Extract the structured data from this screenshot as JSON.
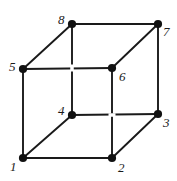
{
  "figure": {
    "kind": "cube-vertex-diagram",
    "width": 177,
    "height": 181,
    "background_color": "#ffffff",
    "edge_color": "#1a1a1a",
    "vertex_color": "#111111",
    "label_color": "#1a1a1a",
    "edge_width": 1.9,
    "hidden_edge_style": "interrupted-at-crossing",
    "vertex_radius": 4.1
  },
  "vertices": [
    {
      "id": "v1",
      "label": "1",
      "x": 23,
      "y": 158,
      "label_x": 10,
      "label_y": 160,
      "hidden": false
    },
    {
      "id": "v2",
      "label": "2",
      "x": 112,
      "y": 158,
      "label_x": 118,
      "label_y": 161,
      "hidden": false
    },
    {
      "id": "v3",
      "label": "3",
      "x": 158,
      "y": 114,
      "label_x": 163,
      "label_y": 116,
      "hidden": false
    },
    {
      "id": "v4",
      "label": "4",
      "x": 72,
      "y": 115,
      "label_x": 58,
      "label_y": 104,
      "hidden": true
    },
    {
      "id": "v5",
      "label": "5",
      "x": 23,
      "y": 69,
      "label_x": 9,
      "label_y": 60,
      "hidden": false
    },
    {
      "id": "v6",
      "label": "6",
      "x": 112,
      "y": 68,
      "label_x": 119,
      "label_y": 70,
      "hidden": false
    },
    {
      "id": "v7",
      "label": "7",
      "x": 158,
      "y": 24,
      "label_x": 163,
      "label_y": 25,
      "hidden": false
    },
    {
      "id": "v8",
      "label": "8",
      "x": 72,
      "y": 24,
      "label_x": 58,
      "label_y": 13,
      "hidden": false
    }
  ],
  "edges": [
    {
      "id": "e-1-2",
      "from": "v1",
      "to": "v2",
      "face": "front",
      "hidden": false
    },
    {
      "id": "e-2-6",
      "from": "v2",
      "to": "v6",
      "face": "front",
      "hidden": false
    },
    {
      "id": "e-6-5",
      "from": "v6",
      "to": "v5",
      "face": "front",
      "hidden": false
    },
    {
      "id": "e-5-1",
      "from": "v5",
      "to": "v1",
      "face": "front",
      "hidden": false
    },
    {
      "id": "e-4-3",
      "from": "v4",
      "to": "v3",
      "face": "back",
      "hidden": true
    },
    {
      "id": "e-3-7",
      "from": "v3",
      "to": "v7",
      "face": "back",
      "hidden": false
    },
    {
      "id": "e-7-8",
      "from": "v7",
      "to": "v8",
      "face": "back",
      "hidden": false
    },
    {
      "id": "e-8-4",
      "from": "v8",
      "to": "v4",
      "face": "back",
      "hidden": true
    },
    {
      "id": "e-1-4",
      "from": "v1",
      "to": "v4",
      "face": "connect",
      "hidden": false
    },
    {
      "id": "e-2-3",
      "from": "v2",
      "to": "v3",
      "face": "connect",
      "hidden": false
    },
    {
      "id": "e-6-7",
      "from": "v6",
      "to": "v7",
      "face": "connect",
      "hidden": false
    },
    {
      "id": "e-5-8",
      "from": "v5",
      "to": "v8",
      "face": "connect",
      "hidden": false
    }
  ],
  "occlusion_gaps": [
    {
      "id": "gap-8-4",
      "on_edge": "e-8-4",
      "x": 72,
      "y": 68,
      "orientation": "vertical",
      "size": 7
    },
    {
      "id": "gap-4-3",
      "on_edge": "e-4-3",
      "x": 112,
      "y": 115,
      "orientation": "horizontal",
      "size": 7
    }
  ]
}
